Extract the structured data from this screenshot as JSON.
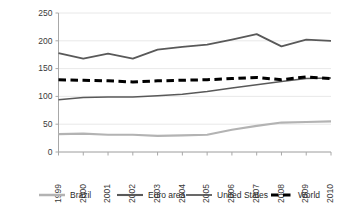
{
  "chart_data": {
    "type": "line",
    "title": "",
    "subtitle": "",
    "xlabel": "",
    "ylabel": "",
    "categories": [
      "1999",
      "2000",
      "2001",
      "2002",
      "2003",
      "2004",
      "2005",
      "2006",
      "2007",
      "2008",
      "2009",
      "2010"
    ],
    "x": [
      1999,
      2000,
      2001,
      2002,
      2003,
      2004,
      2005,
      2006,
      2007,
      2008,
      2009,
      2010
    ],
    "ylim": [
      0,
      250
    ],
    "yticks": [
      0,
      50,
      100,
      150,
      200,
      250
    ],
    "ytick_labels": [
      "0",
      "50",
      "100",
      "150",
      "200",
      "250"
    ],
    "grid": "horizontal",
    "legend_position": "bottom",
    "series": [
      {
        "name": "Brazil",
        "color": "#b3b3b3",
        "style": "solid",
        "width": 2.2,
        "values": [
          32,
          33,
          31,
          31,
          29,
          30,
          31,
          40,
          47,
          53,
          54,
          55
        ]
      },
      {
        "name": "Euro area",
        "color": "#595959",
        "style": "solid",
        "width": 1.8,
        "values": [
          178,
          168,
          177,
          168,
          184,
          189,
          193,
          202,
          212,
          190,
          202,
          200
        ]
      },
      {
        "name": "United States",
        "color": "#595959",
        "style": "solid",
        "width": 1.5,
        "values": [
          94,
          98,
          99,
          99,
          101,
          104,
          109,
          115,
          121,
          127,
          132,
          133
        ]
      },
      {
        "name": "World",
        "color": "#000000",
        "style": "dashed",
        "width": 3.0,
        "values": [
          130,
          129,
          128,
          126,
          128,
          129,
          130,
          132,
          134,
          130,
          135,
          132
        ]
      }
    ]
  },
  "legend": {
    "items": [
      {
        "label": "Brazil"
      },
      {
        "label": "Euro area"
      },
      {
        "label": "United States"
      },
      {
        "label": "World"
      }
    ]
  }
}
